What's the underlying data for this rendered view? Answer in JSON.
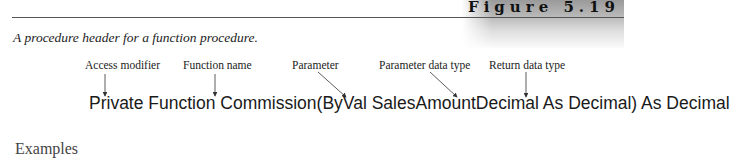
{
  "figure": {
    "label": "Figure 5.19",
    "caption": "A procedure header for a function procedure."
  },
  "annotations": [
    {
      "label": "Access modifier"
    },
    {
      "label": "Function name"
    },
    {
      "label": "Parameter"
    },
    {
      "label": "Parameter data type"
    },
    {
      "label": "Return data type"
    }
  ],
  "code_line": "Private Function Commission(ByVal SalesAmountDecimal As Decimal) As Decimal",
  "next_section_heading": "Examples"
}
